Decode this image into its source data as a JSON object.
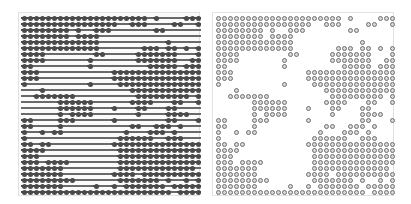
{
  "figure": {
    "panels": [
      {
        "id": "left",
        "style": "filled-markers-with-dashes",
        "rows": 30,
        "cols": 30
      },
      {
        "id": "right",
        "style": "ring-markers",
        "rows": 30,
        "cols": 30
      }
    ],
    "colors": {
      "marker": "#4a4a4a",
      "dash": "#6a6a6a",
      "ring": "#707070",
      "ring_fill": "#d8d8d8",
      "background": "#ffffff"
    }
  },
  "grid": [
    "111111111111111111111010000111",
    "111111111111111100111000011001",
    "111111110100111000000011000000",
    "111111110111100000000000000000",
    "111111111111100000000000100000",
    "111111111111100000001110110101",
    "111100000000110000011111110001",
    "111100000001000000011111110011",
    "110000000001000000000111110111",
    "111000000000000111111111111111",
    "111000000000000111111111111111",
    "100000000001000011111111111111",
    "000100000000000000111111111111",
    "001111111000000000011111111101",
    "000000111111000000111100011001",
    "000000111111000100011000110000",
    "000000101111000000010000111100",
    "110000111000000100000000110001",
    "110000100000000000110011101000",
    "100101100000000001000111010000",
    "100000000000000011111100111000",
    "110110000000000111111111111111",
    "111100000000000011111111111111",
    "111000000000000011111111111111",
    "111011110000000011111111111111",
    "111111100000000011111111111110",
    "111111100000000111101111111111",
    "111111111000000011111110100101",
    "111111100000100101111111011111",
    "111111111111111111111111101111"
  ]
}
